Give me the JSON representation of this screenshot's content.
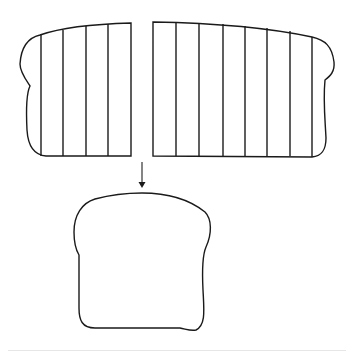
{
  "diagram": {
    "left_half": {
      "slice_count": 5
    },
    "right_half": {
      "slice_count": 8
    },
    "arrow": {
      "direction": "down"
    },
    "result": {
      "shape": "bread-slice"
    },
    "colors": {
      "stroke": "#1a1a1a",
      "background": "#ffffff"
    }
  }
}
